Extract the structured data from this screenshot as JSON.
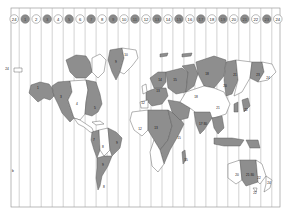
{
  "map": {
    "title": "World Time Zones",
    "frame": {
      "left": 11,
      "top": 8,
      "right": 280,
      "bottom": 207
    },
    "colors": {
      "background": "#ffffff",
      "land_dark": "#8e8e8e",
      "land_light": "#ffffff",
      "outline": "#555555",
      "zone_line": "#9a9a9a",
      "circle_dark": "#8a8a8a",
      "circle_light": "#ffffff"
    },
    "header_zones": [
      {
        "label": "24",
        "shade": "light"
      },
      {
        "label": "1",
        "shade": "dark"
      },
      {
        "label": "2",
        "shade": "light"
      },
      {
        "label": "3",
        "shade": "dark"
      },
      {
        "label": "4",
        "shade": "light"
      },
      {
        "label": "5",
        "shade": "dark"
      },
      {
        "label": "6",
        "shade": "light"
      },
      {
        "label": "7",
        "shade": "dark"
      },
      {
        "label": "8",
        "shade": "light"
      },
      {
        "label": "9",
        "shade": "dark"
      },
      {
        "label": "10",
        "shade": "light"
      },
      {
        "label": "11",
        "shade": "dark"
      },
      {
        "label": "12",
        "shade": "light"
      },
      {
        "label": "13",
        "shade": "dark"
      },
      {
        "label": "14",
        "shade": "light"
      },
      {
        "label": "15",
        "shade": "dark"
      },
      {
        "label": "16",
        "shade": "light"
      },
      {
        "label": "17",
        "shade": "dark"
      },
      {
        "label": "18",
        "shade": "light"
      },
      {
        "label": "19",
        "shade": "dark"
      },
      {
        "label": "20",
        "shade": "light"
      },
      {
        "label": "21",
        "shade": "dark"
      },
      {
        "label": "22",
        "shade": "light"
      },
      {
        "label": "23",
        "shade": "dark"
      },
      {
        "label": "24",
        "shade": "light"
      }
    ],
    "side_labels": {
      "left_edge": "24",
      "bottom_left_glyph": "b"
    },
    "region_labels": [
      {
        "id": "alaska",
        "text": "1",
        "x": 38,
        "y": 88
      },
      {
        "id": "canada-west",
        "text": "3",
        "x": 61,
        "y": 97
      },
      {
        "id": "usa-central",
        "text": "4",
        "x": 77,
        "y": 104
      },
      {
        "id": "canada-east",
        "text": "5",
        "x": 95,
        "y": 108
      },
      {
        "id": "greenland",
        "text": "9",
        "x": 116,
        "y": 62
      },
      {
        "id": "greenland-east",
        "text": "10",
        "x": 126,
        "y": 55
      },
      {
        "id": "south-america-west",
        "text": "7",
        "x": 94,
        "y": 140
      },
      {
        "id": "south-america-central",
        "text": "8",
        "x": 103,
        "y": 147
      },
      {
        "id": "brazil",
        "text": "9",
        "x": 117,
        "y": 143
      },
      {
        "id": "argentina",
        "text": "9",
        "x": 103,
        "y": 165
      },
      {
        "id": "chile-south",
        "text": "8",
        "x": 104,
        "y": 187
      },
      {
        "id": "uk",
        "text": "12",
        "x": 143,
        "y": 103
      },
      {
        "id": "europe-central",
        "text": "13",
        "x": 158,
        "y": 91
      },
      {
        "id": "scandinavia",
        "text": "14",
        "x": 160,
        "y": 80
      },
      {
        "id": "africa-west",
        "text": "12",
        "x": 140,
        "y": 129
      },
      {
        "id": "africa-central",
        "text": "13",
        "x": 156,
        "y": 128
      },
      {
        "id": "africa-east",
        "text": "15",
        "x": 179,
        "y": 138
      },
      {
        "id": "madagascar",
        "text": "15",
        "x": 186,
        "y": 160
      },
      {
        "id": "russia-west",
        "text": "15",
        "x": 175,
        "y": 80
      },
      {
        "id": "russia-central",
        "text": "18",
        "x": 207,
        "y": 74
      },
      {
        "id": "asia-central",
        "text": "18",
        "x": 196,
        "y": 97
      },
      {
        "id": "siberia-east",
        "text": "20",
        "x": 225,
        "y": 86
      },
      {
        "id": "russia-far-east",
        "text": "21",
        "x": 235,
        "y": 75
      },
      {
        "id": "kamchatka",
        "text": "23",
        "x": 258,
        "y": 75
      },
      {
        "id": "chukotka",
        "text": "24",
        "x": 268,
        "y": 78
      },
      {
        "id": "china",
        "text": "21",
        "x": 218,
        "y": 108
      },
      {
        "id": "india",
        "text": "17:30",
        "x": 203,
        "y": 124
      },
      {
        "id": "japan",
        "text": "22",
        "x": 246,
        "y": 110
      },
      {
        "id": "australia-west",
        "text": "20",
        "x": 237,
        "y": 175
      },
      {
        "id": "australia-central",
        "text": "21:30",
        "x": 250,
        "y": 175
      },
      {
        "id": "australia-east",
        "text": "22",
        "x": 259,
        "y": 178
      },
      {
        "id": "tasmania",
        "text": "22",
        "x": 255,
        "y": 193
      },
      {
        "id": "new-zealand",
        "text": "24",
        "x": 269,
        "y": 183
      }
    ]
  }
}
